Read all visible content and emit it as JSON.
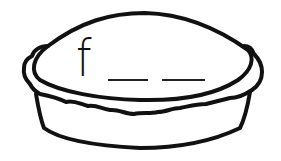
{
  "worksheet": {
    "picture": "pie",
    "word": {
      "first_letter": "f",
      "blank_count": 2
    },
    "colors": {
      "line": "#111111",
      "background": "#ffffff"
    }
  }
}
